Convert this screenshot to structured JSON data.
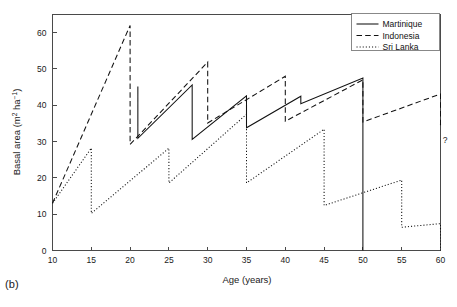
{
  "panel": {
    "label": "(b)"
  },
  "chart_data": {
    "type": "line",
    "title": "",
    "xlabel": "Age (years)",
    "ylabel": "Basal area (m2 ha-1)",
    "ylabel_parts": {
      "base": "Basal area (m",
      "sup1": "2",
      "mid": " ha",
      "sup2": "−1",
      "tail": ")"
    },
    "xlim": [
      10,
      60
    ],
    "ylim": [
      0,
      65
    ],
    "xticks": [
      10,
      15,
      20,
      25,
      30,
      35,
      40,
      45,
      50,
      55,
      60
    ],
    "yticks": [
      0,
      10,
      20,
      30,
      40,
      50,
      60
    ],
    "grid": false,
    "legend_position": "top-right",
    "annotations": [
      {
        "text": "?",
        "x": 60.6,
        "y": 29.5,
        "name": "unknown-future-annotation"
      }
    ],
    "series": [
      {
        "name": "Martinique",
        "style": "solid",
        "points": [
          [
            21.0,
            45.2
          ],
          [
            21.0,
            30.9
          ],
          [
            28.0,
            45.6
          ],
          [
            28.0,
            30.6
          ],
          [
            35.0,
            42.6
          ],
          [
            35.0,
            33.8
          ],
          [
            42.0,
            42.5
          ],
          [
            42.0,
            40.4
          ],
          [
            50.0,
            47.5
          ],
          [
            50.0,
            0.0
          ]
        ]
      },
      {
        "name": "Indonesia",
        "style": "dashed",
        "points": [
          [
            10.0,
            13.0
          ],
          [
            20.0,
            62.0
          ],
          [
            20.0,
            29.2
          ],
          [
            30.0,
            51.9
          ],
          [
            30.0,
            35.1
          ],
          [
            40.0,
            48.0
          ],
          [
            40.0,
            35.6
          ],
          [
            50.0,
            47.0
          ],
          [
            50.0,
            35.4
          ],
          [
            60.0,
            43.1
          ],
          [
            60.0,
            33.6
          ]
        ]
      },
      {
        "name": "Sri Lanka",
        "style": "dotted",
        "points": [
          [
            10.0,
            13.0
          ],
          [
            15.0,
            28.2
          ],
          [
            15.0,
            10.2
          ],
          [
            25.0,
            28.2
          ],
          [
            25.0,
            18.6
          ],
          [
            35.0,
            37.5
          ],
          [
            35.0,
            18.6
          ],
          [
            45.0,
            33.4
          ],
          [
            45.0,
            12.4
          ],
          [
            55.0,
            19.4
          ],
          [
            55.0,
            6.4
          ],
          [
            60.0,
            7.4
          ],
          [
            60.0,
            0.0
          ]
        ]
      }
    ],
    "legend": [
      {
        "label": "Martinique",
        "style": "solid"
      },
      {
        "label": "Indonesia",
        "style": "dashed"
      },
      {
        "label": "Sri Lanka",
        "style": "dotted"
      }
    ]
  }
}
